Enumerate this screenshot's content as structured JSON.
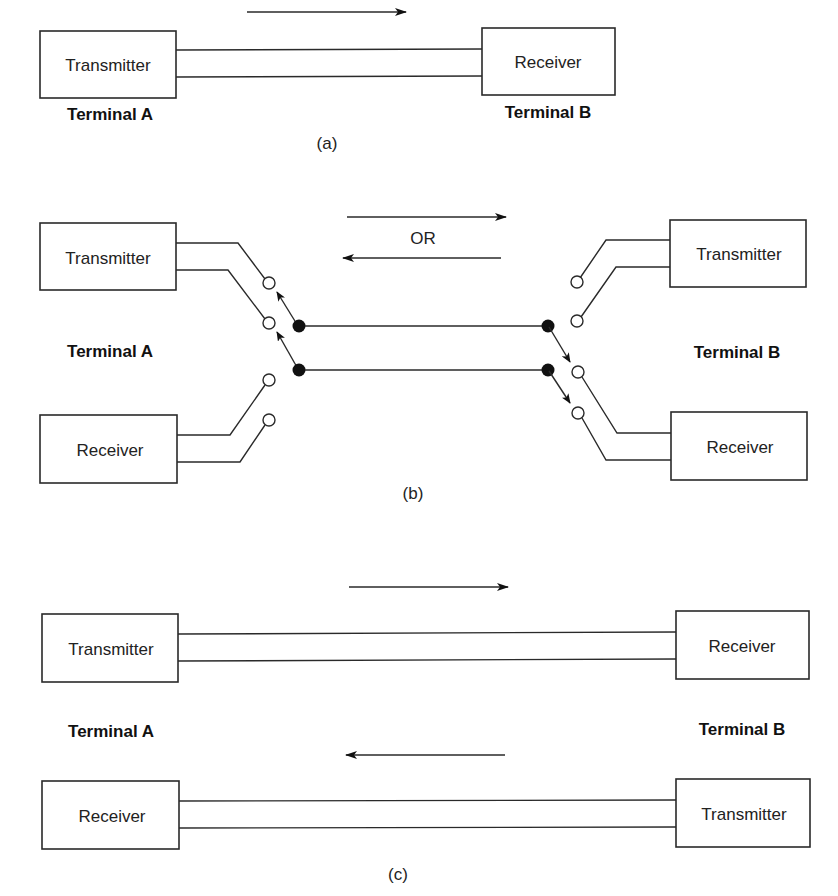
{
  "figure_a": {
    "caption": "(a)",
    "terminal_a_label": "Terminal A",
    "terminal_b_label": "Terminal B",
    "left_box": "Transmitter",
    "right_box": "Receiver",
    "direction": "A to B"
  },
  "figure_b": {
    "caption": "(b)",
    "terminal_a_label": "Terminal A",
    "terminal_b_label": "Terminal B",
    "left_top_box": "Transmitter",
    "left_bottom_box": "Receiver",
    "right_top_box": "Transmitter",
    "right_bottom_box": "Receiver",
    "or_label": "OR",
    "direction": "A to B or B to A"
  },
  "figure_c": {
    "caption": "(c)",
    "terminal_a_label": "Terminal A",
    "terminal_b_label": "Terminal B",
    "left_top_box": "Transmitter",
    "left_bottom_box": "Receiver",
    "right_top_box": "Receiver",
    "right_bottom_box": "Transmitter",
    "direction": "A to B and B to A"
  },
  "colors": {
    "line": "#2a2a2a",
    "background": "#ffffff"
  }
}
